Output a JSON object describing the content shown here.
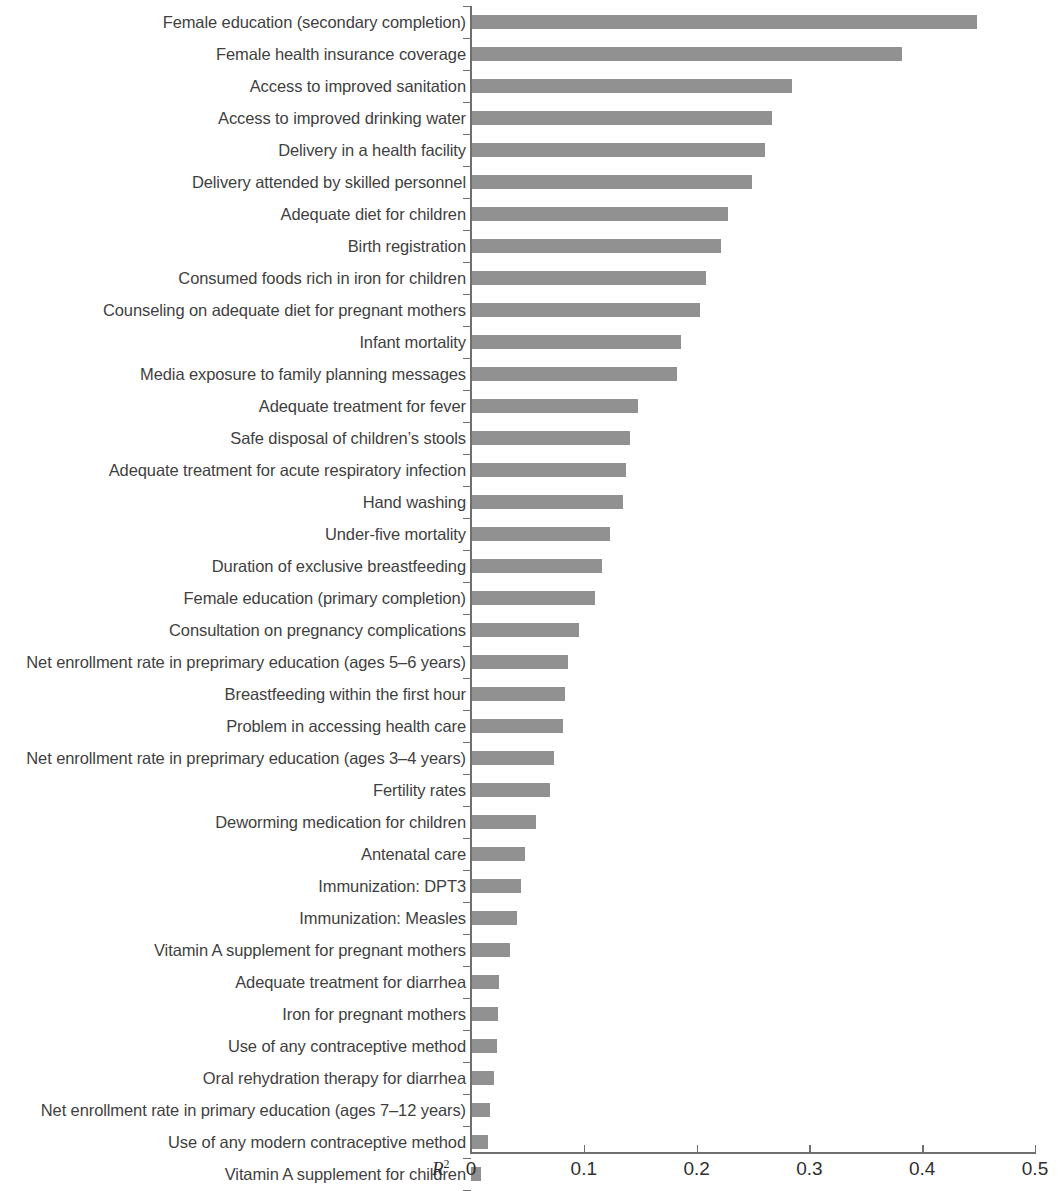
{
  "chart_data": {
    "type": "bar",
    "orientation": "horizontal",
    "title": "",
    "subtitle": "",
    "xlabel": "R2",
    "xlabel_display": "R",
    "xlabel_superscript": "2",
    "ylabel": "",
    "xlim": [
      0,
      0.5
    ],
    "grid": false,
    "legend": null,
    "bar_color": "#919191",
    "axis_color": "#6f6f6f",
    "xticks": [
      0,
      0.1,
      0.2,
      0.3,
      0.4,
      0.5
    ],
    "xtick_labels": [
      "0",
      "0.1",
      "0.2",
      "0.3",
      "0.4",
      "0.5"
    ],
    "categories": [
      "Female education (secondary completion)",
      "Female health insurance coverage",
      "Access to improved sanitation",
      "Access to improved drinking water",
      "Delivery in a health facility",
      "Delivery attended by skilled personnel",
      "Adequate diet for children",
      "Birth registration",
      "Consumed foods rich in iron for children",
      "Counseling on adequate diet for pregnant mothers",
      "Infant  mortality",
      "Media exposure to family planning messages",
      "Adequate treatment for fever",
      "Safe disposal of children’s stools",
      "Adequate treatment for acute respiratory infection",
      "Hand washing",
      "Under-five mortality",
      "Duration of exclusive breastfeeding",
      "Female education (primary completion)",
      "Consultation on pregnancy complications",
      "Net enrollment rate in preprimary education (ages 5–6 years)",
      "Breastfeeding within the first hour",
      "Problem in accessing health care",
      "Net enrollment rate in preprimary education (ages 3–4 years)",
      "Fertility rates",
      "Deworming medication for children",
      "Antenatal care",
      "Immunization: DPT3",
      "Immunization: Measles",
      "Vitamin A supplement for pregnant mothers",
      "Adequate treatment for diarrhea",
      "Iron for pregnant mothers",
      "Use of any contraceptive method",
      "Oral rehydration therapy for diarrhea",
      "Net enrollment rate in primary education (ages 7–12 years)",
      "Use of any modern contraceptive method",
      "Vitamin A supplement for children"
    ],
    "values": [
      0.449,
      0.382,
      0.285,
      0.267,
      0.261,
      0.249,
      0.228,
      0.222,
      0.208,
      0.203,
      0.186,
      0.183,
      0.148,
      0.141,
      0.137,
      0.135,
      0.123,
      0.116,
      0.11,
      0.096,
      0.086,
      0.083,
      0.082,
      0.074,
      0.07,
      0.058,
      0.048,
      0.044,
      0.041,
      0.035,
      0.025,
      0.024,
      0.023,
      0.02,
      0.017,
      0.015,
      0.009
    ]
  }
}
